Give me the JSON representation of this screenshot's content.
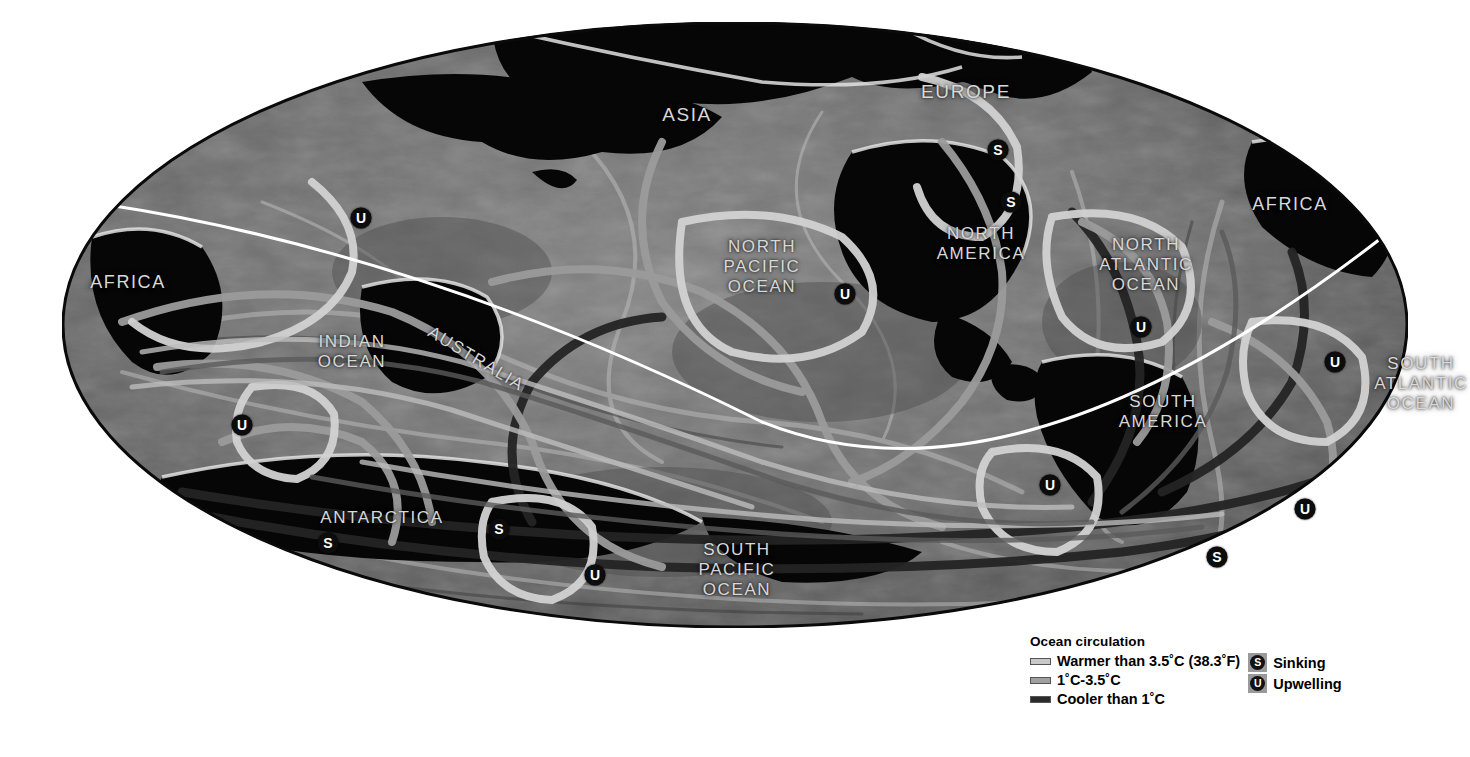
{
  "map": {
    "projection": "mollweide-ellipse",
    "background_color": "#ffffff",
    "ocean_base_color": "#6e6e6e",
    "land_color": "#060606",
    "equator_line_color": "#ffffff",
    "labels": [
      {
        "name": "label-asia",
        "text": "ASIA",
        "x": 625,
        "y": 93,
        "size": 19,
        "rotate": 0
      },
      {
        "name": "label-europe",
        "text": "EUROPE",
        "x": 904,
        "y": 70,
        "size": 19,
        "rotate": 0
      },
      {
        "name": "label-africa-west",
        "text": "AFRICA",
        "x": 66,
        "y": 260,
        "size": 18,
        "rotate": 0
      },
      {
        "name": "label-africa-east",
        "text": "AFRICA",
        "x": 1228,
        "y": 182,
        "size": 18,
        "rotate": 0
      },
      {
        "name": "label-north-america",
        "text": "NORTH\nAMERICA",
        "x": 919,
        "y": 222,
        "size": 17,
        "rotate": 0
      },
      {
        "name": "label-south-america",
        "text": "SOUTH\nAMERICA",
        "x": 1101,
        "y": 390,
        "size": 17,
        "rotate": 0
      },
      {
        "name": "label-north-pacific-ocean",
        "text": "NORTH\nPACIFIC\nOCEAN",
        "x": 700,
        "y": 245,
        "size": 17,
        "rotate": 0
      },
      {
        "name": "label-south-pacific-ocean",
        "text": "SOUTH\nPACIFIC\nOCEAN",
        "x": 675,
        "y": 548,
        "size": 17,
        "rotate": 0
      },
      {
        "name": "label-north-atlantic-ocean",
        "text": "NORTH\nATLANTIC\nOCEAN",
        "x": 1084,
        "y": 243,
        "size": 17,
        "rotate": 0
      },
      {
        "name": "label-south-atlantic-ocean",
        "text": "SOUTH\nATLANTIC\nOCEAN",
        "x": 1359,
        "y": 362,
        "size": 17,
        "rotate": 0
      },
      {
        "name": "label-indian-ocean",
        "text": "INDIAN\nOCEAN",
        "x": 290,
        "y": 330,
        "size": 17,
        "rotate": 0
      },
      {
        "name": "label-australia",
        "text": "AUSTRALIA",
        "x": 414,
        "y": 337,
        "size": 17,
        "rotate": 31
      },
      {
        "name": "label-antarctica",
        "text": "ANTARCTICA",
        "x": 320,
        "y": 496,
        "size": 17,
        "rotate": 0
      }
    ],
    "markers": [
      {
        "name": "marker-upwelling-indian-north",
        "type": "U",
        "x": 299,
        "y": 196
      },
      {
        "name": "marker-upwelling-indian-west",
        "type": "U",
        "x": 180,
        "y": 403
      },
      {
        "name": "marker-sinking-antarctica-west",
        "type": "S",
        "x": 266,
        "y": 521
      },
      {
        "name": "marker-sinking-antarctica-east",
        "type": "S",
        "x": 437,
        "y": 507
      },
      {
        "name": "marker-upwelling-south-pacific-w",
        "type": "U",
        "x": 533,
        "y": 553
      },
      {
        "name": "marker-upwelling-north-pacific",
        "type": "U",
        "x": 783,
        "y": 272
      },
      {
        "name": "marker-sinking-norwegian",
        "type": "S",
        "x": 936,
        "y": 128
      },
      {
        "name": "marker-sinking-labrador",
        "type": "S",
        "x": 949,
        "y": 180
      },
      {
        "name": "marker-upwelling-north-atlantic",
        "type": "U",
        "x": 1079,
        "y": 305
      },
      {
        "name": "marker-upwelling-south-pacific-e",
        "type": "U",
        "x": 988,
        "y": 463
      },
      {
        "name": "marker-upwelling-south-atlantic",
        "type": "U",
        "x": 1273,
        "y": 340
      },
      {
        "name": "marker-upwelling-southern-ocean",
        "type": "U",
        "x": 1243,
        "y": 487
      },
      {
        "name": "marker-sinking-southern-ocean",
        "type": "S",
        "x": 1155,
        "y": 535
      }
    ]
  },
  "legend": {
    "title": "Ocean circulation",
    "flow_classes": [
      {
        "name": "legend-warmer",
        "label": "Warmer than 3.5˚C (38.3˚F)",
        "color": "#c9c9c9"
      },
      {
        "name": "legend-mid",
        "label": "1˚C-3.5˚C",
        "color": "#a0a0a0"
      },
      {
        "name": "legend-cooler",
        "label": "Cooler than 1˚C",
        "color": "#2b2b2b"
      }
    ],
    "markers": [
      {
        "name": "legend-sinking",
        "glyph": "S",
        "label": "Sinking"
      },
      {
        "name": "legend-upwelling",
        "glyph": "U",
        "label": "Upwelling"
      }
    ]
  }
}
